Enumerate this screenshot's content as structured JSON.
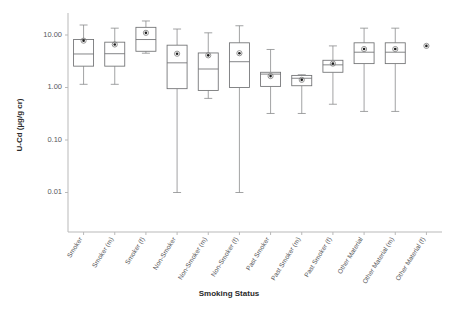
{
  "chart_data": {
    "type": "box",
    "title": "",
    "xlabel": "Smoking Status",
    "ylabel": "U-Cd (µg/g cr)",
    "yscale": "log",
    "ylim": [
      0.004,
      30
    ],
    "ytick_labels": [
      "10.00",
      "1.00",
      "0.10",
      "0.01"
    ],
    "ytick_values": [
      10,
      1,
      0.1,
      0.01
    ],
    "grid": false,
    "legend": "none",
    "categories": [
      "Smoker",
      "Smoker (m)",
      "Smoker (f)",
      "Non-Smoker",
      "Non-Smoker (m)",
      "Non-Smoker (f)",
      "Past Smoker",
      "Past Smoker (m)",
      "Past Smoker (f)",
      "Other Material",
      "Other Material (m)",
      "Other Material (f)"
    ],
    "boxes": [
      {
        "category": "Smoker",
        "lower_whisker": 1.15,
        "q1": 2.55,
        "median": 4.35,
        "q3": 8.2,
        "upper_whisker": 15.5,
        "mean": 7.8
      },
      {
        "category": "Smoker (m)",
        "lower_whisker": 1.15,
        "q1": 2.55,
        "median": 4.4,
        "q3": 7.3,
        "upper_whisker": 13.5,
        "mean": 6.6
      },
      {
        "category": "Smoker (f)",
        "lower_whisker": 4.5,
        "q1": 4.9,
        "median": 8.2,
        "q3": 14.0,
        "upper_whisker": 18.5,
        "mean": 11.0
      },
      {
        "category": "Non-Smoker",
        "lower_whisker": 0.01,
        "q1": 0.95,
        "median": 2.95,
        "q3": 6.4,
        "upper_whisker": 13.0,
        "mean": 4.4
      },
      {
        "category": "Non-Smoker (m)",
        "lower_whisker": 0.62,
        "q1": 0.88,
        "median": 2.25,
        "q3": 4.55,
        "upper_whisker": 11.0,
        "mean": 4.1
      },
      {
        "category": "Non-Smoker (f)",
        "lower_whisker": 0.01,
        "q1": 1.0,
        "median": 3.1,
        "q3": 7.1,
        "upper_whisker": 15.0,
        "mean": 4.5
      },
      {
        "category": "Past Smoker",
        "lower_whisker": 0.32,
        "q1": 1.05,
        "median": 1.8,
        "q3": 1.95,
        "upper_whisker": 5.3,
        "mean": 1.65
      },
      {
        "category": "Past Smoker (m)",
        "lower_whisker": 0.32,
        "q1": 1.08,
        "median": 1.5,
        "q3": 1.7,
        "upper_whisker": 1.75,
        "mean": 1.4
      },
      {
        "category": "Past Smoker (f)",
        "lower_whisker": 0.48,
        "q1": 1.95,
        "median": 2.7,
        "q3": 3.3,
        "upper_whisker": 6.2,
        "mean": 2.85
      },
      {
        "category": "Other Material",
        "lower_whisker": 0.35,
        "q1": 2.85,
        "median": 4.7,
        "q3": 7.1,
        "upper_whisker": 13.5,
        "mean": 5.4
      },
      {
        "category": "Other Material (m)",
        "lower_whisker": 0.35,
        "q1": 2.85,
        "median": 4.7,
        "q3": 7.1,
        "upper_whisker": 13.5,
        "mean": 5.4
      },
      {
        "category": "Other Material (f)",
        "lower_whisker": null,
        "q1": null,
        "median": null,
        "q3": null,
        "upper_whisker": null,
        "mean": 6.2
      }
    ]
  }
}
